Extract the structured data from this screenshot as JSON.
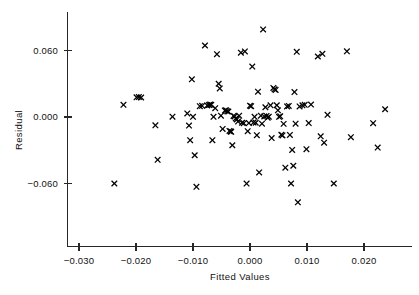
{
  "chart_data": {
    "type": "scatter",
    "title": "",
    "xlabel": "Fitted Values",
    "ylabel": "Residual",
    "xlim": [
      -0.0318,
      0.0295
    ],
    "ylim": [
      -0.095,
      0.093
    ],
    "xticks": [
      -0.03,
      -0.02,
      -0.01,
      0.0,
      0.01,
      0.02
    ],
    "xtick_labels": [
      "-0.030",
      "-0.020",
      "-0.010",
      "0.000",
      "0.010",
      "0.020"
    ],
    "yticks": [
      0.06,
      0.0,
      -0.06
    ],
    "ytick_labels": [
      "0.060",
      "0.000",
      "-0.060"
    ],
    "grid": false,
    "legend": null,
    "marker": "x",
    "marker_color": "#000000",
    "n_points": 106,
    "points": [
      {
        "x": -0.0238,
        "y": -0.06
      },
      {
        "x": -0.0222,
        "y": 0.011
      },
      {
        "x": -0.0199,
        "y": 0.0178
      },
      {
        "x": -0.0195,
        "y": 0.018
      },
      {
        "x": -0.0191,
        "y": 0.0176
      },
      {
        "x": -0.0166,
        "y": -0.0075
      },
      {
        "x": -0.0162,
        "y": -0.0386
      },
      {
        "x": -0.0136,
        "y": 0.0003
      },
      {
        "x": -0.011,
        "y": 0.0032
      },
      {
        "x": -0.0107,
        "y": -0.0077
      },
      {
        "x": -0.0105,
        "y": -0.0209
      },
      {
        "x": -0.0102,
        "y": 0.034
      },
      {
        "x": -0.01,
        "y": 0.0002
      },
      {
        "x": -0.0097,
        "y": -0.0345
      },
      {
        "x": -0.0094,
        "y": -0.063
      },
      {
        "x": -0.0088,
        "y": 0.0098
      },
      {
        "x": -0.0084,
        "y": 0.0101
      },
      {
        "x": -0.0079,
        "y": 0.0645
      },
      {
        "x": -0.0075,
        "y": 0.0104
      },
      {
        "x": -0.0072,
        "y": 0.0108
      },
      {
        "x": -0.007,
        "y": 0.0112
      },
      {
        "x": -0.0068,
        "y": 0.011
      },
      {
        "x": -0.0066,
        "y": -0.0209
      },
      {
        "x": -0.0064,
        "y": 0.0002
      },
      {
        "x": -0.0061,
        "y": 0.008
      },
      {
        "x": -0.0058,
        "y": 0.0567
      },
      {
        "x": -0.0055,
        "y": 0.03
      },
      {
        "x": -0.0053,
        "y": 0.0258
      },
      {
        "x": -0.0051,
        "y": 0.0012
      },
      {
        "x": -0.0048,
        "y": -0.0108
      },
      {
        "x": -0.0044,
        "y": 0.0058
      },
      {
        "x": -0.0042,
        "y": 0.006
      },
      {
        "x": -0.004,
        "y": 0.0051
      },
      {
        "x": -0.0038,
        "y": 0.0049
      },
      {
        "x": -0.0036,
        "y": -0.0126
      },
      {
        "x": -0.0034,
        "y": -0.013
      },
      {
        "x": -0.0033,
        "y": -0.0134
      },
      {
        "x": -0.0031,
        "y": -0.0255
      },
      {
        "x": -0.0029,
        "y": 0.001
      },
      {
        "x": -0.0027,
        "y": 0.0005
      },
      {
        "x": -0.0025,
        "y": -0.0013
      },
      {
        "x": -0.0023,
        "y": -0.0022
      },
      {
        "x": -0.0021,
        "y": -0.0041
      },
      {
        "x": -0.0019,
        "y": 0.0012
      },
      {
        "x": -0.0016,
        "y": 0.058
      },
      {
        "x": -0.0014,
        "y": -0.0052
      },
      {
        "x": -0.0011,
        "y": -0.0056
      },
      {
        "x": -0.0009,
        "y": 0.0592
      },
      {
        "x": -0.0006,
        "y": -0.0601
      },
      {
        "x": -0.0004,
        "y": -0.0128
      },
      {
        "x": -0.0002,
        "y": -0.0055
      },
      {
        "x": 0.0,
        "y": 0.0102
      },
      {
        "x": 0.0002,
        "y": 0.0098
      },
      {
        "x": 0.0004,
        "y": 0.0455
      },
      {
        "x": 0.0006,
        "y": -0.005
      },
      {
        "x": 0.0008,
        "y": 0.0002
      },
      {
        "x": 0.001,
        "y": -0.0052
      },
      {
        "x": 0.0012,
        "y": -0.0164
      },
      {
        "x": 0.0014,
        "y": 0.0228
      },
      {
        "x": 0.0016,
        "y": -0.05
      },
      {
        "x": 0.0019,
        "y": 0.0012
      },
      {
        "x": 0.0021,
        "y": -0.006
      },
      {
        "x": 0.0023,
        "y": 0.079
      },
      {
        "x": 0.0025,
        "y": 0.0005
      },
      {
        "x": 0.0027,
        "y": 0.0088
      },
      {
        "x": 0.0029,
        "y": 0.001
      },
      {
        "x": 0.0031,
        "y": -0.0006
      },
      {
        "x": 0.0033,
        "y": 0.0003
      },
      {
        "x": 0.0036,
        "y": 0.0105
      },
      {
        "x": 0.0038,
        "y": -0.019
      },
      {
        "x": 0.0041,
        "y": 0.0262
      },
      {
        "x": 0.0043,
        "y": 0.025
      },
      {
        "x": 0.0045,
        "y": 0.0244
      },
      {
        "x": 0.0047,
        "y": 0.0106
      },
      {
        "x": 0.0049,
        "y": 0.006
      },
      {
        "x": 0.0051,
        "y": 0.0002
      },
      {
        "x": 0.0053,
        "y": 0.0006
      },
      {
        "x": 0.0055,
        "y": -0.016
      },
      {
        "x": 0.0057,
        "y": -0.0166
      },
      {
        "x": 0.0059,
        "y": -0.0062
      },
      {
        "x": 0.0062,
        "y": -0.0457
      },
      {
        "x": 0.0065,
        "y": 0.0095
      },
      {
        "x": 0.0068,
        "y": 0.01
      },
      {
        "x": 0.007,
        "y": -0.0162
      },
      {
        "x": 0.0072,
        "y": -0.06
      },
      {
        "x": 0.0074,
        "y": -0.0297
      },
      {
        "x": 0.0076,
        "y": -0.044
      },
      {
        "x": 0.0078,
        "y": 0.0225
      },
      {
        "x": 0.008,
        "y": -0.006
      },
      {
        "x": 0.0082,
        "y": 0.0588
      },
      {
        "x": 0.0084,
        "y": -0.077
      },
      {
        "x": 0.0087,
        "y": 0.0095
      },
      {
        "x": 0.0092,
        "y": 0.0105
      },
      {
        "x": 0.0096,
        "y": 0.011
      },
      {
        "x": 0.0099,
        "y": -0.029
      },
      {
        "x": 0.0103,
        "y": -0.0055
      },
      {
        "x": 0.0107,
        "y": 0.0112
      },
      {
        "x": 0.0119,
        "y": 0.0546
      },
      {
        "x": 0.0124,
        "y": -0.0174
      },
      {
        "x": 0.0127,
        "y": 0.057
      },
      {
        "x": 0.013,
        "y": -0.0232
      },
      {
        "x": 0.0136,
        "y": 0.002
      },
      {
        "x": 0.0147,
        "y": -0.06
      },
      {
        "x": 0.017,
        "y": 0.0593
      },
      {
        "x": 0.0177,
        "y": -0.0182
      },
      {
        "x": 0.0216,
        "y": -0.0056
      },
      {
        "x": 0.0224,
        "y": -0.0276
      },
      {
        "x": 0.0237,
        "y": 0.007
      }
    ]
  },
  "axes": {
    "x_axis_name": "x-axis",
    "y_axis_name": "y-axis"
  }
}
